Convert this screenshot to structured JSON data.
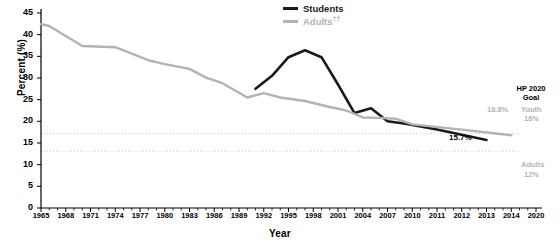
{
  "chart_data": {
    "type": "line",
    "title": "",
    "xlabel": "Year",
    "ylabel": "Percent (%)",
    "ylim": [
      0,
      45
    ],
    "ytick_values": [
      0,
      5,
      10,
      15,
      20,
      25,
      30,
      35,
      40,
      45
    ],
    "ytick_labels": [
      "0",
      "5",
      "10",
      "15",
      "20",
      "25",
      "30",
      "35",
      "40",
      "45"
    ],
    "xlim": [
      1965,
      2020
    ],
    "xtick_labels": [
      "1965",
      "1968",
      "1971",
      "1974",
      "1977",
      "1980",
      "1983",
      "1986",
      "1989",
      "1992",
      "1995",
      "1998",
      "2001",
      "2004",
      "2007",
      "2010",
      "2011",
      "2012",
      "2013",
      "2014",
      "2020"
    ],
    "xtick_values": [
      1965,
      1968,
      1971,
      1974,
      1977,
      1980,
      1983,
      1986,
      1989,
      1992,
      1995,
      1998,
      2001,
      2004,
      2007,
      2010,
      2011,
      2012,
      2013,
      2014,
      2020
    ],
    "grid": false,
    "legend_position": "top-center",
    "series": [
      {
        "name": "Students",
        "color": "#1a1a1a",
        "x": [
          1991,
          1993,
          1995,
          1997,
          1999,
          2001,
          2003,
          2005,
          2007,
          2009,
          2011,
          2013
        ],
        "values": [
          27.5,
          30.5,
          34.8,
          36.4,
          34.8,
          28.5,
          21.9,
          23.0,
          20.0,
          19.5,
          18.1,
          15.7
        ]
      },
      {
        "name": "Adults",
        "color": "#b3b3b3",
        "x": [
          1965,
          1966,
          1970,
          1974,
          1978,
          1980,
          1983,
          1985,
          1987,
          1990,
          1992,
          1994,
          1997,
          2000,
          2002,
          2004,
          2006,
          2008,
          2010,
          2012,
          2014
        ],
        "values": [
          42.4,
          42.0,
          37.4,
          37.1,
          34.1,
          33.2,
          32.1,
          30.1,
          28.8,
          25.5,
          26.5,
          25.5,
          24.7,
          23.3,
          22.5,
          20.9,
          20.8,
          20.6,
          19.3,
          18.1,
          16.8
        ]
      }
    ],
    "reference_lines": [
      {
        "name": "Youth HP2020 goal",
        "value": 16,
        "style": "dotted",
        "color": "#c8c8c8"
      },
      {
        "name": "Adults HP2020 goal",
        "value": 12,
        "style": "dotted",
        "color": "#c8c8c8"
      }
    ],
    "annotations": [
      {
        "name": "hp-2020-goal-title",
        "text": "HP 2020"
      },
      {
        "name": "hp-2020-goal-subtitle",
        "text": "Goal"
      },
      {
        "name": "youth-goal-label",
        "text": "Youth"
      },
      {
        "name": "youth-goal-value",
        "text": "16%"
      },
      {
        "name": "adults-goal-label",
        "text": "Adults"
      },
      {
        "name": "adults-goal-value",
        "text": "12%"
      },
      {
        "name": "adults-last-value",
        "text": "18.8%"
      },
      {
        "name": "students-last-value",
        "text": "15.7%"
      }
    ]
  },
  "legend": {
    "students": {
      "label": "Students",
      "color": "#1a1a1a"
    },
    "adults": {
      "label": "Adults",
      "superscript": "††",
      "color": "#b3b3b3"
    }
  },
  "axes": {
    "y_title": "Percent (%)",
    "x_title": "Year"
  }
}
